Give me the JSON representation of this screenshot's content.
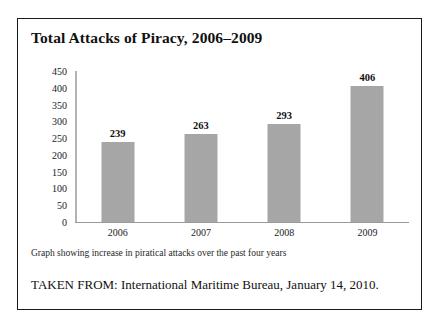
{
  "figure": {
    "title": "Total Attacks of Piracy, 2006–2009",
    "caption": "Graph showing increase in piratical attacks over the past four years",
    "source": "TAKEN FROM: International Maritime Bureau, January 14, 2010.",
    "border_color": "#1a1a1a",
    "background": "#ffffff"
  },
  "chart_data": {
    "type": "bar",
    "title": "Total Attacks of Piracy, 2006–2009",
    "xlabel": "",
    "ylabel": "",
    "categories": [
      "2006",
      "2007",
      "2008",
      "2009"
    ],
    "values": [
      239,
      263,
      293,
      406
    ],
    "ylim": [
      0,
      450
    ],
    "yticks": [
      0,
      50,
      100,
      150,
      200,
      250,
      300,
      350,
      400,
      450
    ],
    "ytick_labels": [
      "0",
      "50",
      "100",
      "150",
      "200",
      "250",
      "300",
      "350",
      "400",
      "450"
    ],
    "data_labels": [
      "239",
      "263",
      "293",
      "406"
    ],
    "bar_color": "#a6a6a6",
    "axis_color": "#999999",
    "grid": false,
    "legend": false
  }
}
